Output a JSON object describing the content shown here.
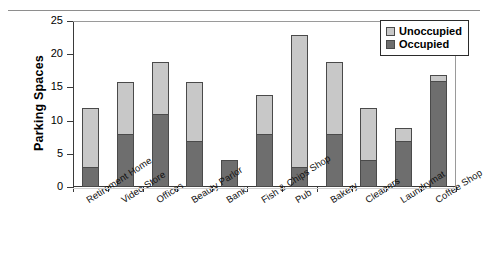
{
  "chart_data": {
    "type": "bar",
    "stacked": true,
    "title": "",
    "xlabel": "",
    "ylabel": "Parking Spaces",
    "ylim": [
      0,
      25
    ],
    "ytick_labels": [
      "0",
      "5",
      "10",
      "15",
      "20",
      "25"
    ],
    "yticks": [
      0,
      5,
      10,
      15,
      20,
      25
    ],
    "grid": false,
    "legend_position": "top-right",
    "categories": [
      "Retirement Home",
      "Video Store",
      "Offices",
      "Beauty Parlor",
      "Bank",
      "Fish & Chips Shop",
      "Pub",
      "Bakery",
      "Cleaners",
      "Laundrymat",
      "Coffee Shop"
    ],
    "series": [
      {
        "name": "Occupied",
        "color": "#6e6e6e",
        "values": [
          3,
          8,
          11,
          7,
          4,
          8,
          3,
          8,
          4,
          7,
          16
        ]
      },
      {
        "name": "Unoccupied",
        "color": "#c8c8c8",
        "values": [
          9,
          8,
          8,
          9,
          0,
          6,
          20,
          11,
          8,
          2,
          1
        ]
      }
    ],
    "totals": [
      12,
      16,
      19,
      16,
      4,
      14,
      23,
      19,
      12,
      9,
      17
    ]
  },
  "legend": {
    "items": [
      {
        "label": "Unoccupied",
        "color": "#c8c8c8"
      },
      {
        "label": "Occupied",
        "color": "#6e6e6e"
      }
    ]
  },
  "axes": {
    "y_title": "Parking Spaces"
  }
}
